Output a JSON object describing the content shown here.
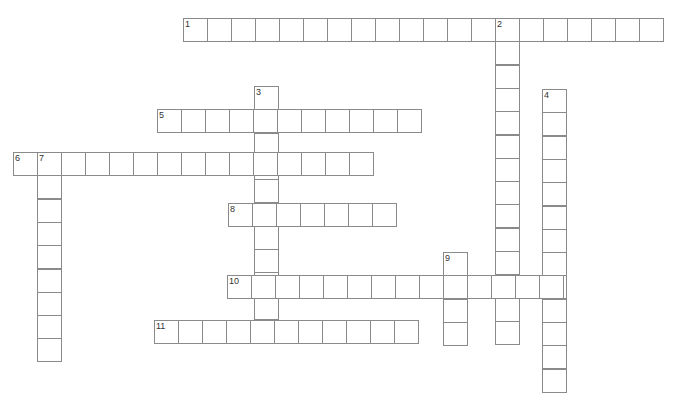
{
  "puzzle": {
    "type": "crossword",
    "cell_width": 24,
    "cell_height": 23.3,
    "line_color": "#8a8a8a",
    "entries": [
      {
        "number": "1",
        "direction": "across",
        "x": 183,
        "y": 18,
        "length": 20
      },
      {
        "number": "2",
        "direction": "down",
        "x": 495,
        "y": 18,
        "length": 14
      },
      {
        "number": "3",
        "direction": "down",
        "x": 254,
        "y": 86,
        "length": 11
      },
      {
        "number": "4",
        "direction": "down",
        "x": 542,
        "y": 89,
        "length": 13
      },
      {
        "number": "5",
        "direction": "across",
        "x": 157,
        "y": 109,
        "length": 11
      },
      {
        "number": "6",
        "direction": "across",
        "x": 13,
        "y": 152,
        "length": 15
      },
      {
        "number": "7",
        "direction": "down",
        "x": 37,
        "y": 152,
        "length": 9
      },
      {
        "number": "8",
        "direction": "across",
        "x": 228,
        "y": 203,
        "length": 7
      },
      {
        "number": "9",
        "direction": "down",
        "x": 443,
        "y": 252,
        "length": 4
      },
      {
        "number": "10",
        "direction": "across",
        "x": 227,
        "y": 275,
        "length": 14
      },
      {
        "number": "11",
        "direction": "across",
        "x": 154,
        "y": 320,
        "length": 11
      }
    ]
  }
}
